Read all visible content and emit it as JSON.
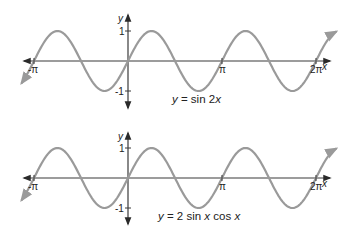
{
  "chart_data": [
    {
      "type": "line",
      "title": "",
      "xlabel": "x",
      "ylabel": "y",
      "xlim": [
        -3.3,
        6.9
      ],
      "ylim": [
        -1.2,
        1.2
      ],
      "grid": false,
      "x_ticks": [
        {
          "value": -3.14159,
          "label": "-π"
        },
        {
          "value": 3.14159,
          "label": "π"
        },
        {
          "value": 6.28318,
          "label": "2π"
        }
      ],
      "y_ticks": [
        {
          "value": 1,
          "label": "1"
        },
        {
          "value": -1,
          "label": "-1"
        }
      ],
      "series": [
        {
          "name": "y = sin 2x",
          "function": "sin(2x)",
          "domain": [
            -3.3,
            6.9
          ],
          "peaks_x": [
            -2.356,
            0.785,
            3.927
          ],
          "troughs_x": [
            -0.785,
            2.356,
            5.498
          ]
        }
      ],
      "annotation": {
        "eq_prefix": "y",
        "eq_equals": " = sin 2",
        "eq_var": "x"
      },
      "arrows": "both-ends"
    },
    {
      "type": "line",
      "title": "",
      "xlabel": "x",
      "ylabel": "y",
      "xlim": [
        -3.3,
        6.9
      ],
      "ylim": [
        -1.2,
        1.2
      ],
      "grid": false,
      "x_ticks": [
        {
          "value": -3.14159,
          "label": "-π"
        },
        {
          "value": 3.14159,
          "label": "π"
        },
        {
          "value": 6.28318,
          "label": "2π"
        }
      ],
      "y_ticks": [
        {
          "value": 1,
          "label": "1"
        },
        {
          "value": -1,
          "label": "-1"
        }
      ],
      "series": [
        {
          "name": "y = 2 sin x cos x",
          "function": "2*sin(x)*cos(x)",
          "domain": [
            -3.3,
            6.9
          ],
          "peaks_x": [
            -2.356,
            0.785,
            3.927
          ],
          "troughs_x": [
            -0.785,
            2.356,
            5.498
          ]
        }
      ],
      "annotation": {
        "eq_parts": [
          "y",
          " = 2 sin ",
          "x",
          " cos ",
          "x"
        ]
      },
      "arrows": "both-ends"
    }
  ]
}
